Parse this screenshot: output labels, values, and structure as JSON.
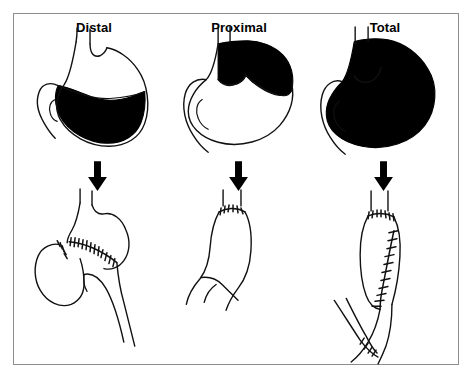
{
  "figure": {
    "kind": "medical-illustration",
    "border_color": "#8d8d90",
    "ink_color": "#111111",
    "fill_color": "#000000",
    "background_color": "#ffffff"
  },
  "panels": [
    {
      "id": "distal",
      "title": "Distal",
      "arrow": "down-arrow",
      "before": {
        "name": "stomach-distal-resection",
        "shaded_region": "antrum-and-distal-body",
        "shaded": "lower-portion"
      },
      "after": {
        "name": "reconstruction-distal",
        "features": [
          "gastric-remnant",
          "duodenal-stump-closure",
          "gastrojejunal-anastomosis-suture-line",
          "jejunal-loop",
          "afferent-limb",
          "efferent-limb"
        ]
      }
    },
    {
      "id": "proximal",
      "title": "Proximal",
      "arrow": "down-arrow",
      "before": {
        "name": "stomach-proximal-resection",
        "shaded_region": "fundus-and-cardia",
        "shaded": "upper-portion"
      },
      "after": {
        "name": "reconstruction-proximal",
        "features": [
          "esophagus",
          "esophagogastric-anastomosis-suture-line",
          "gastric-remnant",
          "duodenum"
        ]
      }
    },
    {
      "id": "total",
      "title": "Total",
      "arrow": "down-arrow",
      "before": {
        "name": "stomach-total-resection",
        "shaded_region": "entire-stomach",
        "shaded": "whole"
      },
      "after": {
        "name": "reconstruction-total",
        "features": [
          "esophagus",
          "esophagojejunal-anastomosis-suture-line",
          "jejunal-pouch",
          "longitudinal-pouch-suture-line",
          "roux-limb",
          "jejunojejunostomy-suture-line"
        ]
      }
    }
  ]
}
